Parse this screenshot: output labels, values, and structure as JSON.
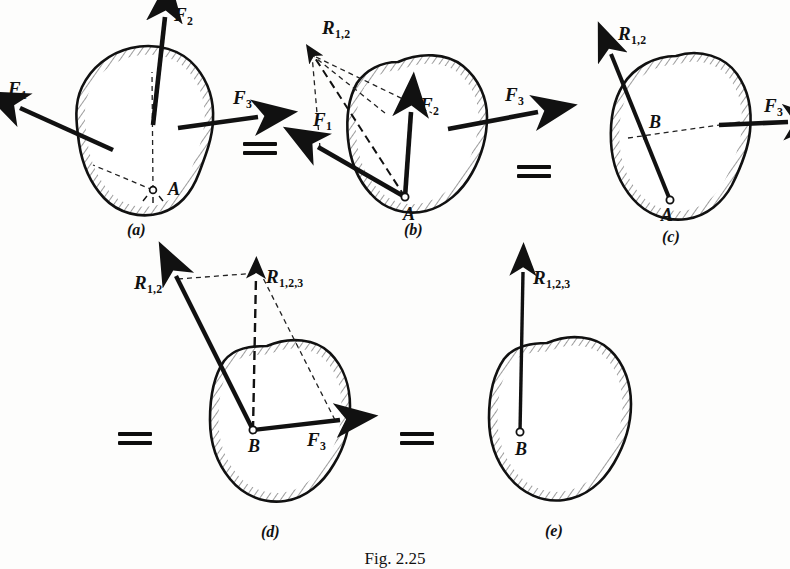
{
  "figure": {
    "caption": "Fig. 2.25"
  },
  "colors": {
    "ink": "#111111",
    "background": "#fdfdfc",
    "hatch": "#2a2a2a",
    "dashed": "#222222"
  },
  "equals_signs": [
    {
      "name": "equals-a-b"
    },
    {
      "name": "equals-b-c"
    },
    {
      "name": "equals-c-d"
    },
    {
      "name": "equals-d-e"
    }
  ],
  "panels": [
    {
      "id": "a",
      "label": "(a)",
      "points": [
        {
          "name": "A",
          "label": "A"
        }
      ],
      "vectors": [
        {
          "name": "F1",
          "base": "F",
          "sub": "1"
        },
        {
          "name": "F2",
          "base": "F",
          "sub": "2"
        },
        {
          "name": "F3",
          "base": "F",
          "sub": "3"
        }
      ]
    },
    {
      "id": "b",
      "label": "(b)",
      "points": [
        {
          "name": "A",
          "label": "A"
        }
      ],
      "vectors": [
        {
          "name": "F1",
          "base": "F",
          "sub": "1"
        },
        {
          "name": "F2",
          "base": "F",
          "sub": "2"
        },
        {
          "name": "F3",
          "base": "F",
          "sub": "3"
        },
        {
          "name": "R12",
          "base": "R",
          "sub": "1,2"
        }
      ]
    },
    {
      "id": "c",
      "label": "(c)",
      "points": [
        {
          "name": "A",
          "label": "A"
        },
        {
          "name": "B",
          "label": "B"
        }
      ],
      "vectors": [
        {
          "name": "R12",
          "base": "R",
          "sub": "1,2"
        },
        {
          "name": "F3",
          "base": "F",
          "sub": "3"
        }
      ]
    },
    {
      "id": "d",
      "label": "(d)",
      "points": [
        {
          "name": "B",
          "label": "B"
        }
      ],
      "vectors": [
        {
          "name": "R12",
          "base": "R",
          "sub": "1,2"
        },
        {
          "name": "F3",
          "base": "F",
          "sub": "3"
        },
        {
          "name": "R123",
          "base": "R",
          "sub": "1,2,3"
        }
      ]
    },
    {
      "id": "e",
      "label": "(e)",
      "points": [
        {
          "name": "B",
          "label": "B"
        }
      ],
      "vectors": [
        {
          "name": "R123",
          "base": "R",
          "sub": "1,2,3"
        }
      ]
    }
  ],
  "labels": {
    "F": "F",
    "R": "R",
    "sub1": "1",
    "sub2": "2",
    "sub3": "3",
    "sub12": "1,2",
    "sub123": "1,2,3",
    "A": "A",
    "B": "B",
    "panel_a": "(a)",
    "panel_b": "(b)",
    "panel_c": "(c)",
    "panel_d": "(d)",
    "panel_e": "(e)"
  }
}
